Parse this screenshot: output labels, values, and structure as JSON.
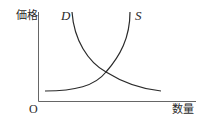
{
  "diagram": {
    "type": "supply-demand",
    "y_axis_label": "価格",
    "x_axis_label": "数量",
    "origin_label": "O",
    "curves": [
      {
        "name": "D",
        "label": "D",
        "description": "demand curve, downward sloping"
      },
      {
        "name": "S",
        "label": "S",
        "description": "supply curve, upward sloping"
      }
    ],
    "colors": {
      "line": "#2a2a2a",
      "axis": "#555555",
      "background": "#ffffff"
    }
  }
}
